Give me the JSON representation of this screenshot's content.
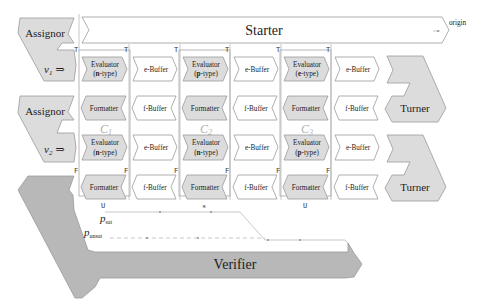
{
  "diagram": {
    "starter": {
      "label": "Starter",
      "origin_label": "origin"
    },
    "assignors": [
      {
        "label": "Assignor"
      },
      {
        "label": "Assignor"
      }
    ],
    "inputs": [
      {
        "label": "v",
        "sub": "1",
        "arrow": "⇒"
      },
      {
        "label": "v",
        "sub": "2",
        "arrow": "⇒"
      }
    ],
    "turners": [
      {
        "label": "Turner"
      },
      {
        "label": "Turner"
      }
    ],
    "verifier": {
      "label": "Verifier"
    },
    "columns": [
      {
        "name": "C",
        "sub": "1"
      },
      {
        "name": "C",
        "sub": "2"
      },
      {
        "name": "C",
        "sub": "3"
      }
    ],
    "row1": {
      "evaluators": [
        {
          "line1": "Evaluator",
          "line2_prefix": "(",
          "type": "n",
          "line2_suffix": "-type)"
        },
        {
          "line1": "Evaluator",
          "line2_prefix": "(",
          "type": "p",
          "line2_suffix": "-type)"
        },
        {
          "line1": "Evaluator",
          "line2_prefix": "(",
          "type": "e",
          "line2_suffix": "-type)"
        }
      ],
      "buffers": [
        "e-Buffer",
        "e-Buffer",
        "e-Buffer"
      ],
      "formatters": [
        "Formatter",
        "Formatter",
        "Formatter"
      ],
      "fbuffers": [
        "f-Buffer",
        "f-Buffer",
        "f-Buffer"
      ],
      "signal": "T"
    },
    "row2": {
      "evaluators": [
        {
          "line1": "Evaluator",
          "line2_prefix": "(",
          "type": "n",
          "line2_suffix": "-type)"
        },
        {
          "line1": "Evaluator",
          "line2_prefix": "(",
          "type": "n",
          "line2_suffix": "-type)"
        },
        {
          "line1": "Evaluator",
          "line2_prefix": "(",
          "type": "p",
          "line2_suffix": "-type)"
        }
      ],
      "buffers": [
        "e-Buffer",
        "e-Buffer",
        "e-Buffer"
      ],
      "formatters": [
        "Formatter",
        "Formatter",
        "Formatter"
      ],
      "fbuffers": [
        "f-Buffer",
        "f-Buffer",
        "f-Buffer"
      ],
      "signal": "F"
    },
    "bottom_marks": {
      "u1": "U",
      "star": "*",
      "u3": "U"
    },
    "paths": {
      "sat": {
        "p": "p",
        "sub": "sat"
      },
      "unsat": {
        "p": "p",
        "sub": "unsat"
      }
    }
  }
}
